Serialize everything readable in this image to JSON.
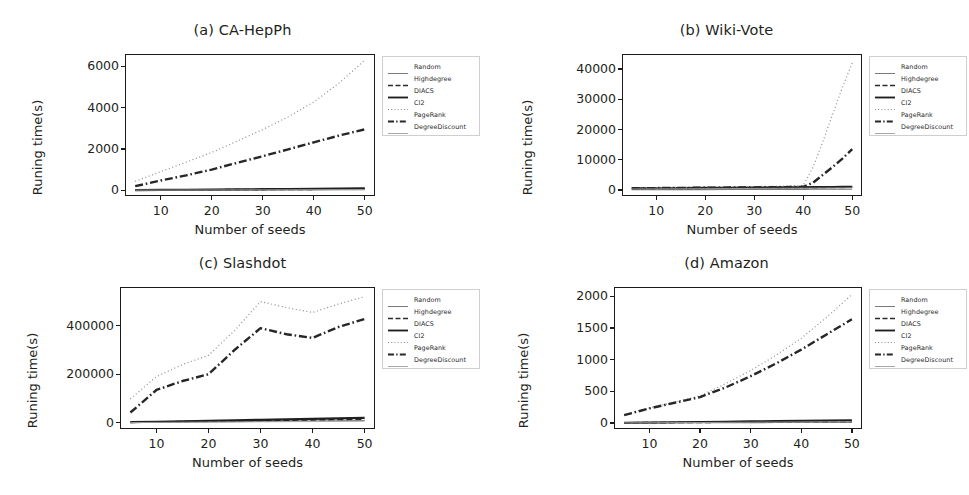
{
  "figure": {
    "panel_count": 4,
    "shared_xlabel": "Number of seeds",
    "shared_ylabel": "Runing time(s)"
  },
  "legend": {
    "entries": [
      {
        "label": "Random",
        "style": "solid",
        "color": "#7a7a7a",
        "width": 1.1
      },
      {
        "label": "Highdegree",
        "style": "dashed",
        "color": "#2b2b2b",
        "width": 1.7
      },
      {
        "label": "DIACS",
        "style": "solid",
        "color": "#1f1f1f",
        "width": 2.2
      },
      {
        "label": "CI2",
        "style": "dotted",
        "color": "#8d8d8d",
        "width": 1.2
      },
      {
        "label": "PageRank",
        "style": "dashdot",
        "color": "#262626",
        "width": 2.4
      },
      {
        "label": "DegreeDiscount",
        "style": "solid",
        "color": "#a8a8a8",
        "width": 0.9
      }
    ]
  },
  "chart_data": [
    {
      "type": "line",
      "title": "(a) CA-HepPh",
      "xlabel": "Number of seeds",
      "ylabel": "Runing time(s)",
      "x": [
        5,
        10,
        15,
        20,
        25,
        30,
        35,
        40,
        45,
        50
      ],
      "xticks": [
        10,
        20,
        30,
        40,
        50
      ],
      "yticks": [
        0,
        2000,
        4000,
        6000
      ],
      "xlim": [
        3,
        52
      ],
      "ylim": [
        -280,
        6600
      ],
      "grid": false,
      "legend_position": "right-outside",
      "series": [
        {
          "name": "Random",
          "values": [
            2,
            4,
            6,
            8,
            11,
            13,
            16,
            18,
            21,
            24
          ]
        },
        {
          "name": "Highdegree",
          "values": [
            5,
            10,
            15,
            21,
            27,
            33,
            39,
            46,
            53,
            60
          ]
        },
        {
          "name": "DIACS",
          "values": [
            8,
            15,
            23,
            31,
            40,
            49,
            58,
            67,
            77,
            88
          ]
        },
        {
          "name": "CI2",
          "values": [
            430,
            900,
            1360,
            1830,
            2380,
            2940,
            3560,
            4270,
            5200,
            6300
          ]
        },
        {
          "name": "PageRank",
          "values": [
            195,
            470,
            720,
            1000,
            1330,
            1650,
            1980,
            2320,
            2650,
            2950
          ]
        },
        {
          "name": "DegreeDiscount",
          "values": [
            3,
            6,
            9,
            12,
            15,
            19,
            22,
            26,
            30,
            34
          ]
        }
      ]
    },
    {
      "type": "line",
      "title": "(b) Wiki-Vote",
      "xlabel": "Number of seeds",
      "ylabel": "Runing time(s)",
      "x": [
        5,
        10,
        15,
        20,
        25,
        30,
        35,
        40,
        42,
        44,
        46,
        48,
        50
      ],
      "xticks": [
        10,
        20,
        30,
        40,
        50
      ],
      "yticks": [
        0,
        10000,
        20000,
        30000,
        40000
      ],
      "xlim": [
        3,
        52
      ],
      "ylim": [
        -2000,
        45000
      ],
      "grid": false,
      "legend_position": "right-outside",
      "series": [
        {
          "name": "Random",
          "values": [
            60,
            80,
            100,
            120,
            140,
            160,
            180,
            200,
            210,
            220,
            230,
            240,
            250
          ]
        },
        {
          "name": "Highdegree",
          "values": [
            420,
            470,
            520,
            560,
            600,
            650,
            700,
            760,
            790,
            820,
            850,
            880,
            910
          ]
        },
        {
          "name": "DIACS",
          "values": [
            500,
            560,
            610,
            660,
            710,
            770,
            830,
            890,
            920,
            950,
            980,
            1010,
            1040
          ]
        },
        {
          "name": "CI2",
          "values": [
            700,
            780,
            860,
            940,
            1020,
            1120,
            1250,
            1500,
            7500,
            16000,
            25000,
            34000,
            42000
          ]
        },
        {
          "name": "PageRank",
          "values": [
            560,
            620,
            680,
            740,
            800,
            860,
            930,
            1050,
            2400,
            5000,
            7600,
            10400,
            13500
          ]
        },
        {
          "name": "DegreeDiscount",
          "values": [
            300,
            340,
            380,
            420,
            460,
            500,
            540,
            580,
            600,
            620,
            640,
            660,
            680
          ]
        }
      ]
    },
    {
      "type": "line",
      "title": "(c) Slashdot",
      "xlabel": "Number of seeds",
      "ylabel": "Runing time(s)",
      "x": [
        5,
        10,
        15,
        20,
        25,
        30,
        35,
        40,
        45,
        50
      ],
      "xticks": [
        10,
        20,
        30,
        40,
        50
      ],
      "yticks": [
        0,
        200000,
        400000
      ],
      "xlim": [
        3,
        52
      ],
      "ylim": [
        -26000,
        560000
      ],
      "grid": false,
      "legend_position": "right-outside",
      "series": [
        {
          "name": "Random",
          "values": [
            900,
            1800,
            2700,
            3600,
            4500,
            5400,
            6300,
            7200,
            8100,
            9000
          ]
        },
        {
          "name": "Highdegree",
          "values": [
            1500,
            3000,
            4500,
            6000,
            7500,
            9000,
            10500,
            12000,
            13500,
            15000
          ]
        },
        {
          "name": "DIACS",
          "values": [
            2000,
            4000,
            6000,
            8000,
            10000,
            12000,
            14000,
            16000,
            18000,
            20000
          ]
        },
        {
          "name": "CI2",
          "values": [
            98000,
            190000,
            240000,
            278000,
            380000,
            500000,
            475000,
            455000,
            490000,
            520000
          ]
        },
        {
          "name": "PageRank",
          "values": [
            42000,
            135000,
            172000,
            200000,
            300000,
            390000,
            365000,
            350000,
            395000,
            428000
          ]
        },
        {
          "name": "DegreeDiscount",
          "values": [
            600,
            1200,
            1800,
            2400,
            3000,
            3600,
            4200,
            4800,
            5400,
            6000
          ]
        }
      ]
    },
    {
      "type": "line",
      "title": "(d) Amazon",
      "xlabel": "Number of seeds",
      "ylabel": "Runing time(s)",
      "x": [
        5,
        10,
        15,
        20,
        25,
        30,
        35,
        40,
        45,
        50
      ],
      "xticks": [
        10,
        20,
        30,
        40,
        50
      ],
      "yticks": [
        0,
        500,
        1000,
        1500,
        2000
      ],
      "xlim": [
        3,
        52
      ],
      "ylim": [
        -95,
        2150
      ],
      "grid": false,
      "legend_position": "right-outside",
      "series": [
        {
          "name": "Random",
          "values": [
            1,
            2,
            3,
            4,
            5,
            6,
            7,
            8,
            9,
            10
          ]
        },
        {
          "name": "Highdegree",
          "values": [
            3,
            5,
            8,
            10,
            13,
            15,
            18,
            20,
            23,
            26
          ]
        },
        {
          "name": "DIACS",
          "values": [
            4,
            8,
            12,
            16,
            20,
            24,
            28,
            32,
            36,
            40
          ]
        },
        {
          "name": "CI2",
          "values": [
            130,
            240,
            330,
            430,
            620,
            830,
            1070,
            1340,
            1670,
            2030
          ]
        },
        {
          "name": "PageRank",
          "values": [
            125,
            230,
            320,
            410,
            560,
            740,
            940,
            1160,
            1400,
            1640
          ]
        },
        {
          "name": "DegreeDiscount",
          "values": [
            2,
            4,
            6,
            8,
            10,
            12,
            14,
            16,
            18,
            20
          ]
        }
      ]
    }
  ]
}
